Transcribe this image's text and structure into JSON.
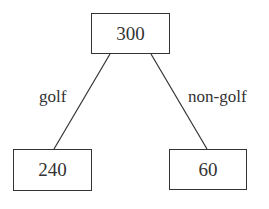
{
  "diagram": {
    "type": "tree",
    "root": {
      "value": "300"
    },
    "children": [
      {
        "value": "240",
        "edge_label": "golf"
      },
      {
        "value": "60",
        "edge_label": "non-golf"
      }
    ]
  },
  "colors": {
    "stroke": "#333333",
    "text": "#333333",
    "background": "#ffffff"
  }
}
